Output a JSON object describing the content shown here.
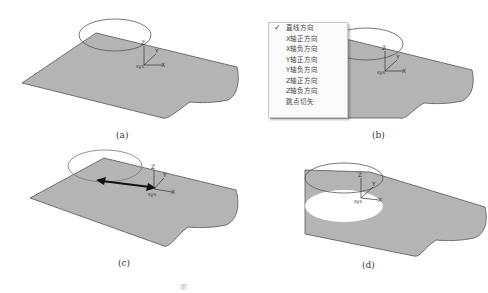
{
  "figure": {
    "panels": [
      {
        "id": "a",
        "label": "(a)"
      },
      {
        "id": "b",
        "label": "(b)"
      },
      {
        "id": "c",
        "label": "(c)"
      },
      {
        "id": "d",
        "label": "(d)"
      }
    ],
    "axis_labels": {
      "z": "Z",
      "y": "Y",
      "x": "X",
      "origin": "sys"
    },
    "colors": {
      "surface": "#b4b4b4",
      "edge": "#555555",
      "ellipse": "#555555",
      "arrow": "#111111",
      "hole": "#ffffff"
    }
  },
  "context_menu": {
    "items": [
      {
        "label": "直线方向",
        "checked": true
      },
      {
        "label": "X轴正方向",
        "checked": false
      },
      {
        "label": "X轴负方向",
        "checked": false
      },
      {
        "label": "Y轴正方向",
        "checked": false
      },
      {
        "label": "Y轴负方向",
        "checked": false
      },
      {
        "label": "Z轴正方向",
        "checked": false
      },
      {
        "label": "Z轴负方向",
        "checked": false
      },
      {
        "label": "跳点切矢",
        "checked": false
      }
    ],
    "check_glyph": "✓"
  },
  "caption": "图"
}
